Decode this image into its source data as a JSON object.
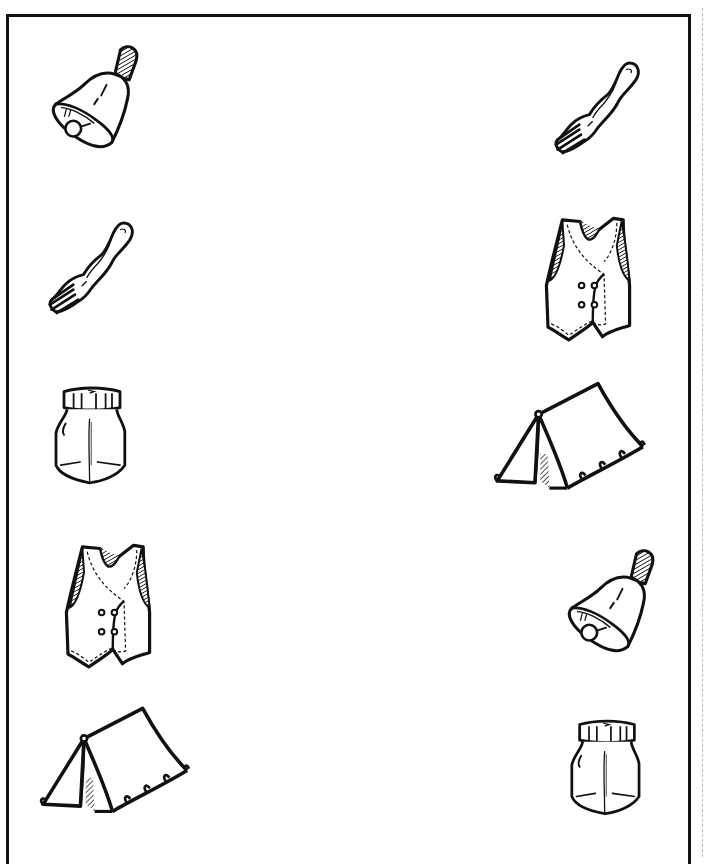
{
  "worksheet": {
    "type": "matching-exercise",
    "border_color": "#111111",
    "left_column": [
      {
        "name": "bell",
        "label": "Bell"
      },
      {
        "name": "fork",
        "label": "Fork"
      },
      {
        "name": "jar",
        "label": "Jar"
      },
      {
        "name": "vest",
        "label": "Vest"
      },
      {
        "name": "tent",
        "label": "Tent"
      }
    ],
    "right_column": [
      {
        "name": "fork",
        "label": "Fork"
      },
      {
        "name": "vest",
        "label": "Vest"
      },
      {
        "name": "tent",
        "label": "Tent"
      },
      {
        "name": "bell",
        "label": "Bell"
      },
      {
        "name": "jar",
        "label": "Jar"
      }
    ]
  }
}
